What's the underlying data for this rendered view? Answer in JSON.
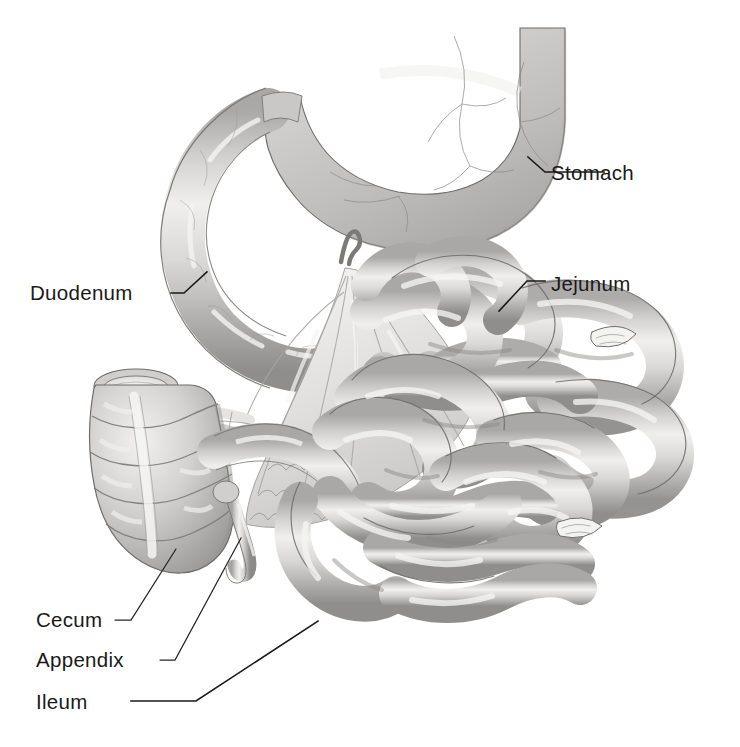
{
  "figure": {
    "background_color": "#ffffff",
    "width": 740,
    "height": 747,
    "style": "grayscale medical illustration"
  },
  "palette": {
    "organ_light": "#e3e2e0",
    "organ_mid": "#c6c5c3",
    "organ_shadow": "#9d9c9a",
    "organ_deep_shadow": "#7e7d7b",
    "organ_highlight": "#f4f4f3",
    "mesentery_light": "#efefee",
    "mesentery_mid": "#d5d4d2",
    "outline": "#6e6d6b",
    "vessel": "#8d8c8a",
    "label_color": "#1a1a1a",
    "leader_color": "#1a1a1a"
  },
  "labels": [
    {
      "id": "stomach",
      "text": "Stomach",
      "text_x": 551,
      "text_y": 180,
      "anchor": "start",
      "leader_points": "528,157 545,172 604,172",
      "target": "greater curvature of stomach"
    },
    {
      "id": "duodenum",
      "text": "Duodenum",
      "text_x": 30,
      "text_y": 300,
      "anchor": "start",
      "leader_points": "207,272 184,293 171,293",
      "target": "descending duodenum loop"
    },
    {
      "id": "jejunum",
      "text": "Jejunum",
      "text_x": 551,
      "text_y": 291,
      "anchor": "start",
      "leader_points": "499,311 527,281 545,281",
      "target": "upper jejunal coil"
    },
    {
      "id": "cecum",
      "text": "Cecum",
      "text_x": 36,
      "text_y": 627,
      "anchor": "start",
      "leader_points": "176,549 131,620 115,620",
      "target": "cecum sacculation"
    },
    {
      "id": "appendix",
      "text": "Appendix",
      "text_x": 36,
      "text_y": 667,
      "anchor": "start",
      "leader_points": "241,538 175,660 160,660",
      "target": "vermiform appendix tip"
    },
    {
      "id": "ileum",
      "text": "Ileum",
      "text_x": 36,
      "text_y": 709,
      "anchor": "start",
      "leader_points": "318,621 196,701 131,701",
      "target": "terminal ileum loop"
    }
  ],
  "structures": [
    {
      "id": "stomach",
      "name": "Stomach",
      "description": "Large J-shaped organ occupying the upper right of the figure, body and greater curvature visible, surface veins drawn in fine line."
    },
    {
      "id": "duodenum",
      "name": "Duodenum",
      "description": "C-shaped tube continuing from the pylorus, curving down and left then back to the right."
    },
    {
      "id": "jejunum",
      "name": "Jejunum",
      "description": "Upper coils of small intestine on the right side, wider caliber loops."
    },
    {
      "id": "ileum",
      "name": "Ileum",
      "description": "Lower coils of small intestine, narrower loops descending to the lower left."
    },
    {
      "id": "cecum",
      "name": "Cecum",
      "description": "Sacculated pouch at the left with haustra and taenia coli, open cut end at top."
    },
    {
      "id": "appendix",
      "name": "Appendix",
      "description": "Narrow worm-like tube hanging from the lower cecum."
    },
    {
      "id": "mesentery",
      "name": "Mesentery",
      "description": "Fan-shaped fold of peritoneum in the centre suspending the small intestine, vessels radiating from the root."
    }
  ]
}
